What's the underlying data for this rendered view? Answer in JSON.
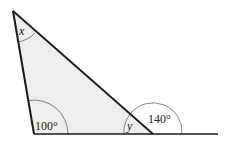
{
  "diagram": {
    "type": "triangle-angles",
    "fill_color": "#eeeeee",
    "line_color": "#1a1a1a",
    "vertices": {
      "top": [
        13,
        11
      ],
      "bottom_left": [
        34,
        134
      ],
      "bottom_right": [
        153,
        134
      ]
    },
    "extension_end": [
      218,
      134
    ],
    "labels": {
      "top_angle": "x",
      "bottom_left_angle": "100°",
      "bottom_right_interior": "y",
      "exterior_angle": "140°"
    }
  }
}
